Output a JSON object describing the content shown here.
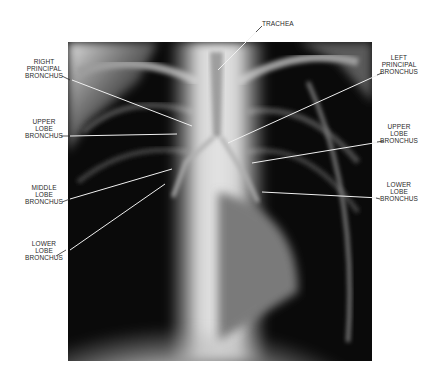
{
  "figure": {
    "labels": {
      "trachea": "TRACHEA",
      "right_principal_bronchus": "RIGHT\nPRINCIPAL\nBRONCHUS",
      "right_upper_lobe_bronchus": "UPPER\nLOBE\nBRONCHUS",
      "middle_lobe_bronchus": "MIDDLE\nLOBE\nBRONCHUS",
      "right_lower_lobe_bronchus": "LOWER\nLOBE\nBRONCHUS",
      "left_principal_bronchus": "LEFT\nPRINCIPAL\nBRONCHUS",
      "left_upper_lobe_bronchus": "UPPER\nLOBE\nBRONCHUS",
      "left_lower_lobe_bronchus": "LOWER\nLOBE\nBRONCHUS"
    },
    "colors": {
      "background": "#ffffff",
      "film_dark": "#0a0a0a",
      "bone_light": "#e6e6e6",
      "label_text": "#2a2a2a",
      "leader_line": "#f0f0f0"
    }
  }
}
